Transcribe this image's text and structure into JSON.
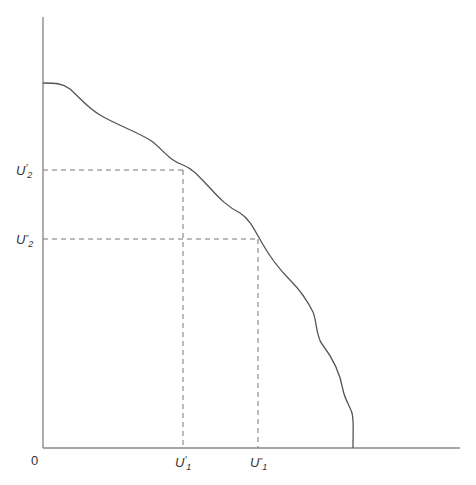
{
  "chart_data": {
    "type": "line",
    "title": "",
    "xlabel": "",
    "ylabel": "",
    "grid": false,
    "legend": null,
    "origin_label": "0",
    "x_ticks": [
      {
        "label": "U'1",
        "main": "U",
        "prime": "'",
        "sub": "1",
        "x_px": 183
      },
      {
        "label": "U''1",
        "main": "U",
        "prime": "″",
        "sub": "1",
        "x_px": 258
      }
    ],
    "y_ticks": [
      {
        "label": "U'2",
        "main": "U",
        "prime": "'",
        "sub": "2",
        "y_px": 170
      },
      {
        "label": "U''2",
        "main": "U",
        "prime": "″",
        "sub": "2",
        "y_px": 239
      }
    ],
    "series": [
      {
        "name": "utility possibility frontier",
        "description": "Downward-sloping wavy frontier from y-axis to x-axis",
        "points_px": [
          [
            43,
            83
          ],
          [
            60,
            84
          ],
          [
            70,
            90
          ],
          [
            95,
            113
          ],
          [
            115,
            125
          ],
          [
            140,
            136
          ],
          [
            160,
            149
          ],
          [
            175,
            160
          ],
          [
            183,
            165
          ],
          [
            200,
            178
          ],
          [
            215,
            195
          ],
          [
            228,
            208
          ],
          [
            243,
            217
          ],
          [
            258,
            239
          ],
          [
            270,
            258
          ],
          [
            285,
            274
          ],
          [
            300,
            290
          ],
          [
            312,
            311
          ],
          [
            318,
            330
          ],
          [
            330,
            346
          ],
          [
            340,
            364
          ],
          [
            344,
            386
          ],
          [
            350,
            400
          ],
          [
            353,
            412
          ],
          [
            353,
            448
          ]
        ]
      }
    ],
    "guide_lines": [
      {
        "from": [
          43,
          170
        ],
        "to": [
          183,
          170
        ],
        "style": "dashed"
      },
      {
        "from": [
          183,
          170
        ],
        "to": [
          183,
          448
        ],
        "style": "dashed"
      },
      {
        "from": [
          43,
          239
        ],
        "to": [
          258,
          239
        ],
        "style": "dashed"
      },
      {
        "from": [
          258,
          239
        ],
        "to": [
          258,
          448
        ],
        "style": "dashed"
      }
    ],
    "axes": {
      "origin_px": [
        43,
        448
      ],
      "y_axis_top_px": 17,
      "x_axis_right_px": 460,
      "color": "#777777"
    },
    "colors": {
      "curve": "#555555",
      "dashes": "#777777",
      "text": "#333333"
    }
  }
}
